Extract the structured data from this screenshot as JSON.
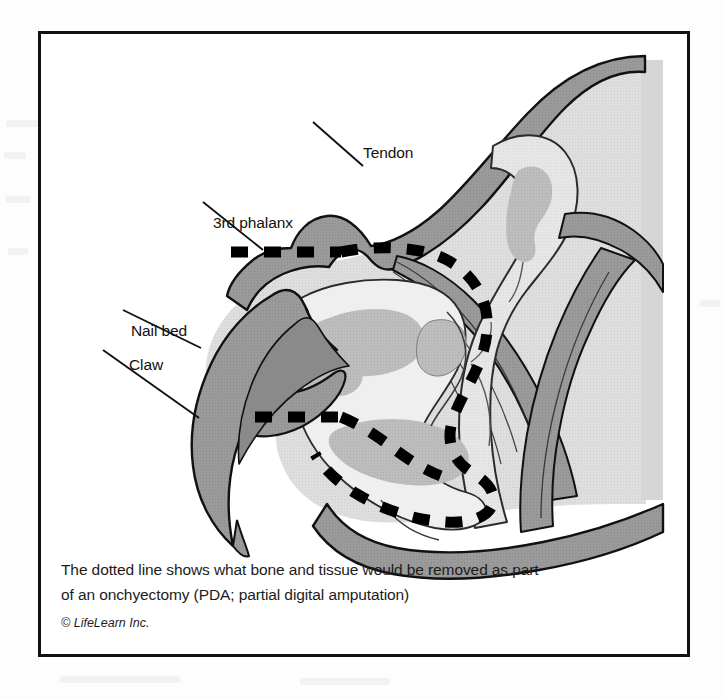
{
  "figure": {
    "labels": [
      {
        "id": "tendon",
        "text": "Tendon"
      },
      {
        "id": "third_phalanx",
        "text": "3rd phalanx"
      },
      {
        "id": "nail_bed",
        "text": "Nail bed"
      },
      {
        "id": "claw",
        "text": "Claw"
      }
    ],
    "caption": {
      "line1": "The dotted line shows what bone and tissue would be removed as part",
      "line2": "of an onchyectomy (PDA; partial digital amputation)",
      "copyright": "© LifeLearn Inc."
    },
    "colors": {
      "frame": "#111111",
      "outline": "#111111",
      "page_background": "#ffffff",
      "tissue_light": "#dcdcdc",
      "tissue_mid": "#b8b8b8",
      "tissue_dark": "#8f8f8f",
      "claw_fill": "#9a9a9a",
      "claw_dark": "#7a7a7a",
      "bone_fill": "#e4e4e4",
      "marrow": "#b0b0b0",
      "cut_line": "#000000"
    },
    "cut_line": {
      "style": "dashed",
      "meaning": "amputation margin",
      "segments": [
        "upper-horizontal",
        "around-third-phalanx",
        "lower-horizontal"
      ]
    }
  }
}
